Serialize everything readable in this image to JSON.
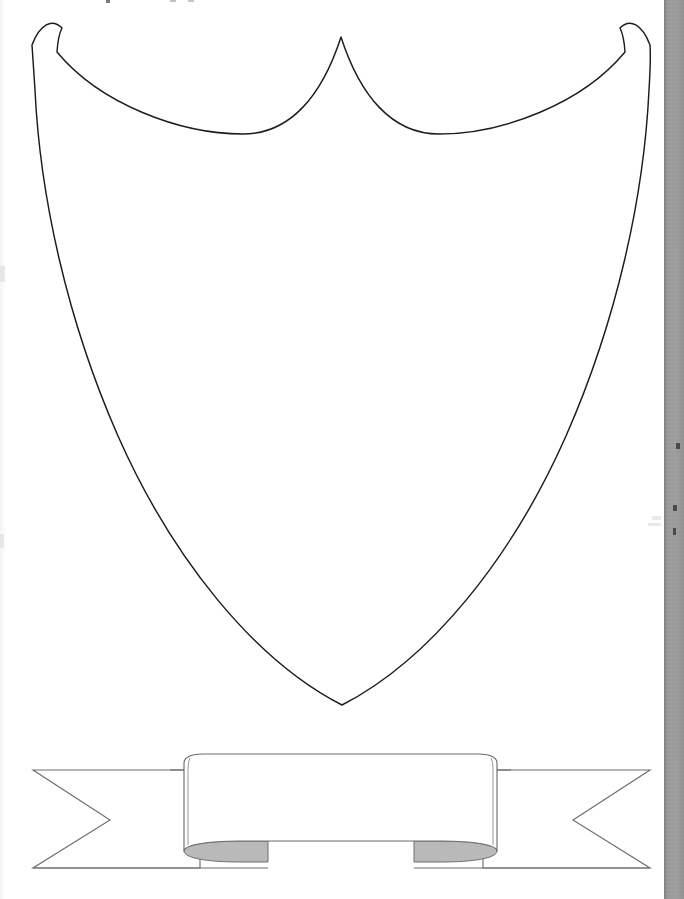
{
  "page": {
    "background_color": "#ffffff",
    "width": 684,
    "height": 899
  },
  "shield": {
    "name": "Heraldic shield outline",
    "fill_color": "#ffffff",
    "stroke_color": "#1c1c1c",
    "stroke_width": 1.4,
    "top_left_corner": "32,45",
    "top_right_corner": "645,45",
    "center_apex": "341,37",
    "bottom_point": "342,705",
    "label": ""
  },
  "banner": {
    "name": "Ribbon banner with swallowtail ends",
    "fill_color": "#ffffff",
    "stroke_color": "#6e6e6e",
    "shadow_color": "#b9b9b9",
    "stroke_width": 1.1,
    "left_tail_tip_x": 33,
    "right_tail_tip_x": 650,
    "notch_left_x": 110,
    "notch_right_x": 573,
    "tail_top_y": 770,
    "tail_bottom_y": 868,
    "center_panel_left_x": 184,
    "center_panel_right_x": 497,
    "center_panel_top_y": 754,
    "center_panel_bottom_y": 856,
    "label": ""
  },
  "scan_gutter": {
    "name": "Scanner gutter bar",
    "color": "#9a9a9a",
    "edge_color": "#7f7f7f",
    "left_x": 664,
    "width": 20
  }
}
